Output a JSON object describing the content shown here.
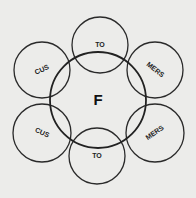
{
  "diagram": {
    "type": "venn-ring",
    "background": "#ececea",
    "stroke": "#2a2a2a",
    "center": {
      "label": "F",
      "cx": 98,
      "cy": 100,
      "r": 48
    },
    "satellites": [
      {
        "id": "top",
        "label": "TO",
        "cx": 100,
        "cy": 45,
        "r": 28,
        "rotate": 0
      },
      {
        "id": "top-right",
        "label": "MERS",
        "cx": 155,
        "cy": 70,
        "r": 28,
        "rotate": 38
      },
      {
        "id": "bottom-right",
        "label": "MERS",
        "cx": 155,
        "cy": 133,
        "r": 29,
        "rotate": -35
      },
      {
        "id": "bottom",
        "label": "TO",
        "cx": 97,
        "cy": 156,
        "r": 28,
        "rotate": 0
      },
      {
        "id": "bottom-left",
        "label": "CUS",
        "cx": 42,
        "cy": 133,
        "r": 29,
        "rotate": 25
      },
      {
        "id": "top-left",
        "label": "CUS",
        "cx": 42,
        "cy": 70,
        "r": 28,
        "rotate": -25
      }
    ]
  }
}
